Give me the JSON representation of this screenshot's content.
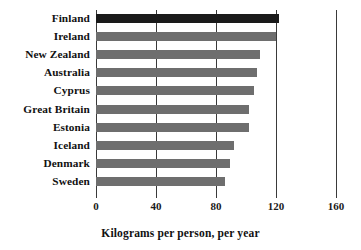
{
  "chart_data": {
    "type": "bar",
    "orientation": "horizontal",
    "title": "",
    "xlabel": "Kilograms per person, per year",
    "ylabel": "",
    "xlim": [
      0,
      160
    ],
    "xticks": [
      0,
      40,
      80,
      120,
      160
    ],
    "xtick_labels": [
      "0",
      "40",
      "80",
      "120",
      "160"
    ],
    "grid": true,
    "grid_axis": "x",
    "legend": false,
    "categories": [
      "Finland",
      "Ireland",
      "New Zealand",
      "Australia",
      "Cyprus",
      "Great Britain",
      "Estonia",
      "Iceland",
      "Denmark",
      "Sweden"
    ],
    "values": [
      122,
      120,
      109,
      107,
      105,
      102,
      102,
      92,
      89,
      86
    ],
    "highlight_index": 0,
    "colors": {
      "bar": "#6e6e6e",
      "bar_highlight": "#1a1a1a",
      "gridline": "#3a3a3a",
      "text": "#111111",
      "background": "#ffffff"
    }
  }
}
